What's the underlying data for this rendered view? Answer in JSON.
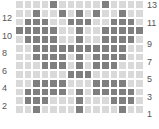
{
  "chart": {
    "rows": 13,
    "cols": 15,
    "left_labels": [
      "12",
      "10",
      "8",
      "6",
      "4",
      "2"
    ],
    "right_labels": [
      "13",
      "11",
      "9",
      "7",
      "5",
      "3",
      "1"
    ],
    "colors": {
      "filled": "#7f7f7f",
      "empty": "#d9d9d9"
    },
    "pattern": [
      [
        0,
        0,
        0,
        0,
        1,
        0,
        0,
        0,
        0,
        0,
        1,
        0,
        0,
        0,
        0
      ],
      [
        0,
        0,
        1,
        0,
        0,
        1,
        0,
        1,
        0,
        1,
        0,
        0,
        1,
        0,
        0
      ],
      [
        0,
        1,
        1,
        1,
        0,
        0,
        1,
        1,
        1,
        0,
        0,
        1,
        1,
        1,
        0
      ],
      [
        1,
        1,
        1,
        1,
        1,
        0,
        0,
        1,
        0,
        0,
        1,
        1,
        1,
        1,
        1
      ],
      [
        0,
        1,
        1,
        1,
        1,
        0,
        0,
        1,
        0,
        0,
        1,
        1,
        1,
        1,
        0
      ],
      [
        0,
        0,
        1,
        1,
        1,
        1,
        1,
        1,
        1,
        1,
        1,
        1,
        1,
        0,
        0
      ],
      [
        0,
        0,
        1,
        1,
        1,
        1,
        0,
        1,
        0,
        1,
        1,
        1,
        1,
        0,
        0
      ],
      [
        0,
        0,
        0,
        1,
        1,
        1,
        0,
        1,
        0,
        1,
        1,
        1,
        0,
        0,
        0
      ],
      [
        0,
        0,
        0,
        0,
        0,
        0,
        1,
        1,
        1,
        0,
        0,
        0,
        0,
        0,
        0
      ],
      [
        0,
        0,
        1,
        1,
        1,
        1,
        0,
        0,
        0,
        1,
        1,
        1,
        1,
        0,
        0
      ],
      [
        0,
        1,
        1,
        1,
        1,
        1,
        0,
        1,
        0,
        1,
        1,
        1,
        1,
        1,
        0
      ],
      [
        0,
        1,
        1,
        1,
        0,
        0,
        0,
        1,
        0,
        0,
        0,
        1,
        1,
        1,
        0
      ],
      [
        0,
        0,
        1,
        0,
        0,
        0,
        0,
        1,
        0,
        0,
        0,
        0,
        1,
        0,
        0
      ]
    ]
  }
}
